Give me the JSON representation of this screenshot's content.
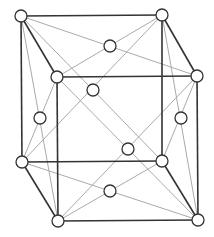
{
  "diagram": {
    "type": "face-centered cubic unit cell",
    "colors": {
      "edge": "#333333",
      "diagonal": "#aaaaaa",
      "atom_fill": "#ffffff",
      "atom_stroke": "#333333"
    },
    "atom_radius": 6,
    "nodes": {
      "BTL": [
        21,
        16
      ],
      "BTR": [
        162,
        15
      ],
      "BBL": [
        22,
        162
      ],
      "BBR": [
        162,
        161
      ],
      "FTL": [
        57,
        77
      ],
      "FTR": [
        197,
        76
      ],
      "FBL": [
        58,
        221
      ],
      "FBR": [
        198,
        220
      ],
      "C_top": [
        110,
        46
      ],
      "C_bottom": [
        110,
        191
      ],
      "C_left": [
        40,
        118
      ],
      "C_right": [
        181,
        118
      ],
      "C_back": [
        93,
        90
      ],
      "C_front": [
        128,
        149
      ]
    },
    "dark_edges": [
      [
        "BTL",
        "BTR"
      ],
      [
        "BTL",
        "BBL"
      ],
      [
        "BTR",
        "BBR"
      ],
      [
        "BBL",
        "BBR"
      ],
      [
        "FTL",
        "FTR"
      ],
      [
        "FTL",
        "FBL"
      ],
      [
        "FTR",
        "FBR"
      ],
      [
        "FBL",
        "FBR"
      ],
      [
        "BTL",
        "FTL"
      ],
      [
        "BTR",
        "FTR"
      ],
      [
        "BBL",
        "FBL"
      ],
      [
        "BBR",
        "FBR"
      ]
    ],
    "light_edges": [
      [
        "BTL",
        "FTR"
      ],
      [
        "BTR",
        "FTL"
      ],
      [
        "BBL",
        "FBR"
      ],
      [
        "BBR",
        "FBL"
      ],
      [
        "BTL",
        "FBL"
      ],
      [
        "FTL",
        "BBL"
      ],
      [
        "BTR",
        "FBR"
      ],
      [
        "FTR",
        "BBR"
      ],
      [
        "BTL",
        "BBR"
      ],
      [
        "BTR",
        "BBL"
      ],
      [
        "FTL",
        "FBR"
      ],
      [
        "FTR",
        "FBL"
      ]
    ]
  }
}
